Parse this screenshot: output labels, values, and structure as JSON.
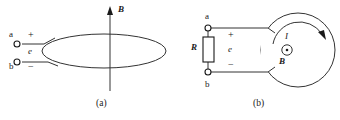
{
  "figure": {
    "colors": {
      "ink": "#1a1a1a",
      "stroke": "#333333",
      "background": "#ffffff"
    },
    "panels": [
      {
        "id": "a",
        "caption": "(a)",
        "labels": {
          "terminal_top": "a",
          "terminal_bottom": "b",
          "polarity_positive": "+",
          "polarity_negative": "−",
          "emf": "e",
          "b_field": "B"
        }
      },
      {
        "id": "b",
        "caption": "(b)",
        "labels": {
          "terminal_top": "a",
          "terminal_bottom": "b",
          "polarity_positive": "+",
          "polarity_negative": "−",
          "emf": "e",
          "resistor": "R",
          "current": "I",
          "b_field": "B"
        }
      }
    ]
  }
}
